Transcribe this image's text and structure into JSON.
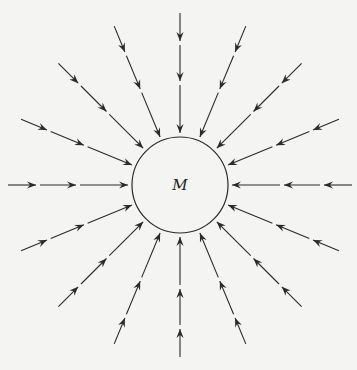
{
  "diagram": {
    "mass_label": "M",
    "center": [
      180,
      185
    ],
    "radius": 48,
    "line_color": "#2a2a2a",
    "background": "#f4f4f2",
    "directions_count": 16,
    "segments_per_line": [
      {
        "from": 52,
        "to": 100
      },
      {
        "from": 104,
        "to": 140
      },
      {
        "from": 144,
        "to": 172
      }
    ],
    "arrow_direction": "inward"
  }
}
